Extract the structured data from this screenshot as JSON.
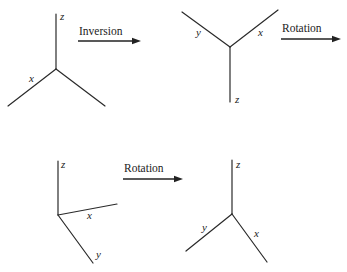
{
  "diagram": {
    "panels": [
      {
        "id": "original",
        "origin": [
          56,
          69
        ],
        "axes": [
          {
            "label": "z",
            "end": [
              56,
              14
            ],
            "label_pos": [
              60,
              20
            ]
          },
          {
            "label": "x",
            "end": [
              8,
              106
            ],
            "label_pos": [
              29,
              82
            ]
          },
          {
            "label": "",
            "end": [
              105,
              106
            ],
            "label_pos": [
              0,
              0
            ]
          }
        ]
      },
      {
        "id": "after-inversion",
        "origin": [
          230,
          47
        ],
        "axes": [
          {
            "label": "y",
            "end": [
              182,
              12
            ],
            "label_pos": [
              196,
              36
            ]
          },
          {
            "label": "x",
            "end": [
              278,
              10
            ],
            "label_pos": [
              258,
              36
            ]
          },
          {
            "label": "z",
            "end": [
              230,
              102
            ],
            "label_pos": [
              235,
              103
            ]
          }
        ]
      },
      {
        "id": "after-rotation-1",
        "origin": [
          58,
          215
        ],
        "axes": [
          {
            "label": "z",
            "end": [
              58,
              161
            ],
            "label_pos": [
              61,
              168
            ]
          },
          {
            "label": "x",
            "end": [
              117,
              204
            ],
            "label_pos": [
              87,
              219
            ]
          },
          {
            "label": "y",
            "end": [
              93,
              263
            ],
            "label_pos": [
              96,
              258
            ]
          }
        ]
      },
      {
        "id": "after-rotation-2",
        "origin": [
          232,
          214
        ],
        "axes": [
          {
            "label": "z",
            "end": [
              232,
              160
            ],
            "label_pos": [
              236,
              168
            ]
          },
          {
            "label": "y",
            "end": [
              186,
              251
            ],
            "label_pos": [
              202,
              231
            ]
          },
          {
            "label": "x",
            "end": [
              267,
              262
            ],
            "label_pos": [
              254,
              237
            ]
          }
        ]
      }
    ],
    "operations": [
      {
        "label": "Inversion",
        "text_pos": [
          79,
          35
        ],
        "line": [
          78,
          41,
          140,
          41
        ]
      },
      {
        "label": "Rotation",
        "text_pos": [
          282,
          32
        ],
        "line": [
          281,
          39,
          340,
          39
        ]
      },
      {
        "label": "Rotation",
        "text_pos": [
          124,
          172
        ],
        "line": [
          123,
          179,
          182,
          179
        ]
      }
    ]
  }
}
